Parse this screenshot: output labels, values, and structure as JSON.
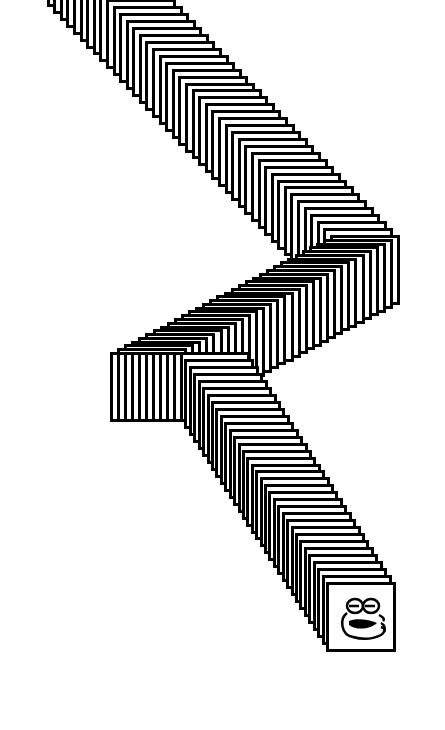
{
  "desktop": {
    "background": "#ffffff",
    "description": "window drag trail"
  },
  "trail": {
    "frame_size": 70,
    "border_color": "#000000",
    "fill_color": "#ffffff",
    "step": 7,
    "waypoints": [
      [
        40,
        -70
      ],
      [
        330,
        235
      ],
      [
        110,
        352
      ],
      [
        180,
        352
      ],
      [
        326,
        582
      ]
    ]
  },
  "final_window": {
    "icon": "frog-face-icon"
  }
}
